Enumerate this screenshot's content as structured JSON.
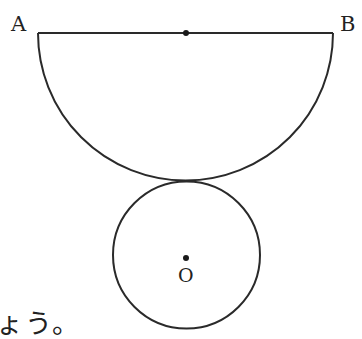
{
  "figure": {
    "points": {
      "A": "A",
      "B": "B",
      "O": "O"
    },
    "caption_fragment": "ょう。",
    "stroke_color": "#2a2a2a",
    "shapes": {
      "diameter_AB": {
        "x1": 38,
        "y1": 33,
        "x2": 333,
        "y2": 33
      },
      "semicircle": {
        "cx": 185.5,
        "cy": 33,
        "r": 147.5,
        "orientation": "downward"
      },
      "ab_midpoint_dot": {
        "cx": 186,
        "cy": 33,
        "r": 3
      },
      "circle_O": {
        "cx": 186.5,
        "cy": 255,
        "r": 73.5
      },
      "center_O_dot": {
        "cx": 186,
        "cy": 258,
        "r": 3
      },
      "tangent_point": {
        "x": 186,
        "y": 181
      }
    }
  }
}
